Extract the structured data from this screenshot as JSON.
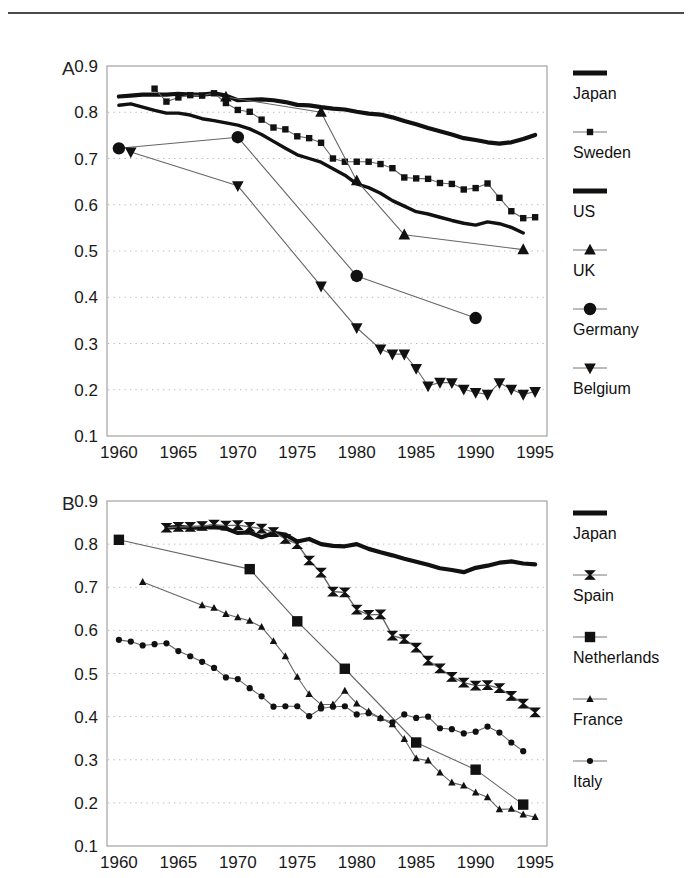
{
  "figure": {
    "background": "#ffffff",
    "rule_color": "#4a4a4a",
    "ink_color": "#111111",
    "grid_color": "#b8b8b8"
  },
  "panels": [
    {
      "letter": "A",
      "id": "panelA"
    },
    {
      "letter": "B",
      "id": "panelB"
    }
  ],
  "chart_data": [
    {
      "type": "line",
      "panel": "A",
      "title": "",
      "xlabel": "",
      "ylabel": "",
      "xlim": [
        1959,
        1996
      ],
      "ylim": [
        0.1,
        0.9
      ],
      "xticks": [
        1960,
        1965,
        1970,
        1975,
        1980,
        1985,
        1990,
        1995
      ],
      "yticks": [
        0.1,
        0.2,
        0.3,
        0.4,
        0.5,
        0.6,
        0.7,
        0.8,
        0.9
      ],
      "xticklabels": [
        "1960",
        "1965",
        "1970",
        "1975",
        "1980",
        "1985",
        "1990",
        "1995"
      ],
      "yticklabels": [
        "0.1",
        "0.2",
        "0.3",
        "0.4",
        "0.5",
        "0.6",
        "0.7",
        "0.8",
        "0.9"
      ],
      "grid": "horizontal-dotted",
      "legend_position": "right",
      "series": [
        {
          "name": "Japan",
          "marker": "none",
          "line": "thick",
          "linewidth": 4.2,
          "x": [
            1960,
            1961,
            1962,
            1963,
            1964,
            1965,
            1966,
            1967,
            1968,
            1969,
            1970,
            1971,
            1972,
            1973,
            1974,
            1975,
            1976,
            1977,
            1978,
            1979,
            1980,
            1981,
            1982,
            1983,
            1984,
            1985,
            1986,
            1987,
            1988,
            1989,
            1990,
            1991,
            1992,
            1993,
            1994,
            1995
          ],
          "y": [
            0.834,
            0.836,
            0.838,
            0.838,
            0.838,
            0.84,
            0.838,
            0.838,
            0.841,
            0.836,
            0.826,
            0.827,
            0.828,
            0.826,
            0.822,
            0.816,
            0.815,
            0.811,
            0.808,
            0.806,
            0.801,
            0.797,
            0.795,
            0.789,
            0.781,
            0.774,
            0.766,
            0.759,
            0.752,
            0.744,
            0.74,
            0.735,
            0.732,
            0.735,
            0.742,
            0.751
          ]
        },
        {
          "name": "Sweden",
          "marker": "square",
          "line": "thin",
          "linewidth": 1.1,
          "x": [
            1963,
            1964,
            1965,
            1966,
            1967,
            1968,
            1969,
            1970,
            1971,
            1972,
            1973,
            1974,
            1975,
            1976,
            1977,
            1978,
            1979,
            1980,
            1981,
            1982,
            1983,
            1984,
            1985,
            1986,
            1987,
            1988,
            1989,
            1990,
            1991,
            1992,
            1993,
            1994,
            1995
          ],
          "y": [
            0.851,
            0.823,
            0.832,
            0.837,
            0.836,
            0.841,
            0.82,
            0.805,
            0.801,
            0.784,
            0.767,
            0.763,
            0.748,
            0.744,
            0.734,
            0.7,
            0.693,
            0.693,
            0.693,
            0.688,
            0.679,
            0.659,
            0.657,
            0.656,
            0.647,
            0.645,
            0.633,
            0.636,
            0.646,
            0.615,
            0.586,
            0.571,
            0.573
          ]
        },
        {
          "name": "US",
          "marker": "none",
          "line": "thick",
          "linewidth": 3.4,
          "x": [
            1960,
            1961,
            1962,
            1963,
            1964,
            1965,
            1966,
            1967,
            1968,
            1969,
            1970,
            1971,
            1972,
            1973,
            1974,
            1975,
            1976,
            1977,
            1978,
            1979,
            1980,
            1981,
            1982,
            1983,
            1984,
            1985,
            1986,
            1987,
            1988,
            1989,
            1990,
            1991,
            1992,
            1993,
            1994
          ],
          "y": [
            0.815,
            0.818,
            0.811,
            0.804,
            0.798,
            0.798,
            0.794,
            0.786,
            0.782,
            0.777,
            0.772,
            0.764,
            0.752,
            0.737,
            0.722,
            0.708,
            0.7,
            0.692,
            0.678,
            0.664,
            0.645,
            0.637,
            0.625,
            0.609,
            0.597,
            0.585,
            0.58,
            0.573,
            0.566,
            0.56,
            0.556,
            0.563,
            0.559,
            0.551,
            0.539
          ]
        },
        {
          "name": "UK",
          "marker": "triangle-up",
          "line": "thin",
          "linewidth": 1.1,
          "x": [
            1969,
            1977,
            1980,
            1984,
            1994
          ],
          "y": [
            0.833,
            0.8,
            0.652,
            0.535,
            0.503
          ]
        },
        {
          "name": "Germany",
          "marker": "circle",
          "line": "thin",
          "linewidth": 1.1,
          "x": [
            1960,
            1970,
            1980,
            1990
          ],
          "y": [
            0.722,
            0.746,
            0.446,
            0.355
          ]
        },
        {
          "name": "Belgium",
          "marker": "triangle-down",
          "line": "thin",
          "linewidth": 1.1,
          "x": [
            1961,
            1970,
            1977,
            1980,
            1982,
            1983,
            1984,
            1985,
            1986,
            1987,
            1988,
            1989,
            1990,
            1991,
            1992,
            1993,
            1994,
            1995
          ],
          "y": [
            0.714,
            0.641,
            0.424,
            0.334,
            0.288,
            0.277,
            0.277,
            0.246,
            0.208,
            0.216,
            0.215,
            0.201,
            0.194,
            0.19,
            0.215,
            0.201,
            0.19,
            0.196
          ]
        }
      ]
    },
    {
      "type": "line",
      "panel": "B",
      "title": "",
      "xlabel": "",
      "ylabel": "",
      "xlim": [
        1959,
        1996
      ],
      "ylim": [
        0.1,
        0.9
      ],
      "xticks": [
        1960,
        1965,
        1970,
        1975,
        1980,
        1985,
        1990,
        1995
      ],
      "yticks": [
        0.1,
        0.2,
        0.3,
        0.4,
        0.5,
        0.6,
        0.7,
        0.8,
        0.9
      ],
      "xticklabels": [
        "1960",
        "1965",
        "1970",
        "1975",
        "1980",
        "1985",
        "1990",
        "1995"
      ],
      "yticklabels": [
        "0.1",
        "0.2",
        "0.3",
        "0.4",
        "0.5",
        "0.6",
        "0.7",
        "0.8",
        "0.9"
      ],
      "grid": "horizontal-dotted",
      "legend_position": "right",
      "series": [
        {
          "name": "Japan",
          "marker": "none",
          "line": "thick",
          "linewidth": 4.2,
          "x": [
            1964,
            1965,
            1966,
            1967,
            1968,
            1969,
            1970,
            1971,
            1972,
            1973,
            1974,
            1975,
            1976,
            1977,
            1978,
            1979,
            1980,
            1981,
            1982,
            1983,
            1984,
            1985,
            1986,
            1987,
            1988,
            1989,
            1990,
            1991,
            1992,
            1993,
            1994,
            1995
          ],
          "y": [
            0.838,
            0.84,
            0.838,
            0.838,
            0.841,
            0.836,
            0.826,
            0.827,
            0.816,
            0.826,
            0.822,
            0.806,
            0.812,
            0.8,
            0.796,
            0.795,
            0.8,
            0.789,
            0.781,
            0.774,
            0.766,
            0.759,
            0.752,
            0.744,
            0.74,
            0.735,
            0.745,
            0.75,
            0.757,
            0.76,
            0.755,
            0.753
          ]
        },
        {
          "name": "Spain",
          "marker": "bowtie",
          "line": "thin",
          "linewidth": 1.4,
          "x": [
            1964,
            1965,
            1966,
            1967,
            1968,
            1969,
            1970,
            1971,
            1972,
            1973,
            1974,
            1975,
            1976,
            1977,
            1978,
            1979,
            1980,
            1981,
            1982,
            1983,
            1984,
            1985,
            1986,
            1987,
            1988,
            1989,
            1990,
            1991,
            1992,
            1993,
            1994,
            1995
          ],
          "y": [
            0.838,
            0.84,
            0.84,
            0.842,
            0.845,
            0.843,
            0.844,
            0.84,
            0.836,
            0.828,
            0.812,
            0.8,
            0.762,
            0.734,
            0.69,
            0.688,
            0.648,
            0.636,
            0.637,
            0.588,
            0.58,
            0.56,
            0.53,
            0.512,
            0.492,
            0.479,
            0.472,
            0.473,
            0.466,
            0.448,
            0.43,
            0.41
          ]
        },
        {
          "name": "Netherlands",
          "marker": "square-large",
          "line": "thin",
          "linewidth": 1.1,
          "x": [
            1960,
            1971,
            1975,
            1979,
            1985,
            1990,
            1994
          ],
          "y": [
            0.81,
            0.742,
            0.621,
            0.511,
            0.34,
            0.277,
            0.196
          ]
        },
        {
          "name": "France",
          "marker": "triangle-up-small",
          "line": "thin",
          "linewidth": 1.1,
          "x": [
            1962,
            1967,
            1968,
            1969,
            1970,
            1971,
            1972,
            1973,
            1974,
            1975,
            1976,
            1977,
            1978,
            1979,
            1980,
            1981,
            1982,
            1983,
            1984,
            1985,
            1986,
            1987,
            1988,
            1989,
            1990,
            1991,
            1992,
            1993,
            1994,
            1995
          ],
          "y": [
            0.712,
            0.658,
            0.652,
            0.638,
            0.63,
            0.622,
            0.608,
            0.575,
            0.54,
            0.492,
            0.452,
            0.428,
            0.428,
            0.46,
            0.43,
            0.412,
            0.397,
            0.382,
            0.348,
            0.303,
            0.298,
            0.27,
            0.247,
            0.24,
            0.224,
            0.213,
            0.185,
            0.186,
            0.173,
            0.167
          ]
        },
        {
          "name": "Italy",
          "marker": "circle-small",
          "line": "thin",
          "linewidth": 1.1,
          "x": [
            1960,
            1961,
            1962,
            1963,
            1964,
            1965,
            1966,
            1967,
            1968,
            1969,
            1970,
            1971,
            1972,
            1973,
            1974,
            1975,
            1976,
            1977,
            1978,
            1979,
            1980,
            1981,
            1982,
            1983,
            1984,
            1985,
            1986,
            1987,
            1988,
            1989,
            1990,
            1991,
            1992,
            1993,
            1994
          ],
          "y": [
            0.578,
            0.574,
            0.565,
            0.568,
            0.57,
            0.552,
            0.54,
            0.527,
            0.513,
            0.491,
            0.487,
            0.466,
            0.447,
            0.423,
            0.424,
            0.424,
            0.401,
            0.419,
            0.423,
            0.424,
            0.405,
            0.408,
            0.396,
            0.387,
            0.405,
            0.397,
            0.4,
            0.373,
            0.371,
            0.361,
            0.365,
            0.377,
            0.363,
            0.34,
            0.32
          ]
        }
      ]
    }
  ],
  "legends": [
    {
      "panel": "A",
      "entries": [
        {
          "label": "Japan",
          "marker": "none",
          "line": "thick"
        },
        {
          "label": "Sweden",
          "marker": "square",
          "line": "thin"
        },
        {
          "label": "US",
          "marker": "none",
          "line": "thick"
        },
        {
          "label": "UK",
          "marker": "triangle-up",
          "line": "thin"
        },
        {
          "label": "Germany",
          "marker": "circle",
          "line": "thin"
        },
        {
          "label": "Belgium",
          "marker": "triangle-down",
          "line": "thin"
        }
      ]
    },
    {
      "panel": "B",
      "entries": [
        {
          "label": "Japan",
          "marker": "none",
          "line": "thick"
        },
        {
          "label": "Spain",
          "marker": "bowtie",
          "line": "thin"
        },
        {
          "label": "Netherlands",
          "marker": "square-large",
          "line": "thin"
        },
        {
          "label": "France",
          "marker": "triangle-up-small",
          "line": "thin"
        },
        {
          "label": "Italy",
          "marker": "circle-small",
          "line": "thin"
        }
      ]
    }
  ]
}
